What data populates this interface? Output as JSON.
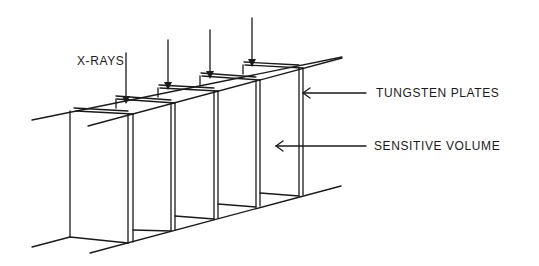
{
  "diagram": {
    "type": "schematic",
    "labels": {
      "xrays": "X-RAYS",
      "tungsten_plates": "TUNGSTEN PLATES",
      "sensitive_volume": "SENSITIVE VOLUME"
    },
    "counts": {
      "xray_arrows": 4,
      "tungsten_plates": 5
    },
    "colors": {
      "line": "#1a1a1a",
      "background": "#ffffff"
    }
  }
}
